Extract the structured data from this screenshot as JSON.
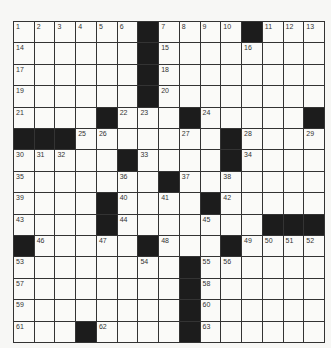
{
  "puzzle": {
    "rows": 15,
    "cols": 15,
    "blocks": [
      [
        0,
        6
      ],
      [
        0,
        11
      ],
      [
        1,
        6
      ],
      [
        2,
        6
      ],
      [
        3,
        6
      ],
      [
        4,
        4
      ],
      [
        4,
        8
      ],
      [
        4,
        14
      ],
      [
        5,
        0
      ],
      [
        5,
        1
      ],
      [
        5,
        2
      ],
      [
        5,
        10
      ],
      [
        6,
        5
      ],
      [
        6,
        10
      ],
      [
        7,
        7
      ],
      [
        8,
        4
      ],
      [
        8,
        9
      ],
      [
        9,
        4
      ],
      [
        9,
        12
      ],
      [
        9,
        13
      ],
      [
        9,
        14
      ],
      [
        10,
        0
      ],
      [
        10,
        6
      ],
      [
        10,
        10
      ],
      [
        11,
        8
      ],
      [
        12,
        8
      ],
      [
        13,
        8
      ],
      [
        14,
        3
      ],
      [
        14,
        8
      ]
    ],
    "numbers": [
      {
        "r": 0,
        "c": 0,
        "n": "1"
      },
      {
        "r": 0,
        "c": 1,
        "n": "2"
      },
      {
        "r": 0,
        "c": 2,
        "n": "3"
      },
      {
        "r": 0,
        "c": 3,
        "n": "4"
      },
      {
        "r": 0,
        "c": 4,
        "n": "5"
      },
      {
        "r": 0,
        "c": 5,
        "n": "6"
      },
      {
        "r": 0,
        "c": 7,
        "n": "7"
      },
      {
        "r": 0,
        "c": 8,
        "n": "8"
      },
      {
        "r": 0,
        "c": 9,
        "n": "9"
      },
      {
        "r": 0,
        "c": 10,
        "n": "10"
      },
      {
        "r": 0,
        "c": 12,
        "n": "11"
      },
      {
        "r": 0,
        "c": 13,
        "n": "12"
      },
      {
        "r": 0,
        "c": 14,
        "n": "13"
      },
      {
        "r": 1,
        "c": 0,
        "n": "14"
      },
      {
        "r": 1,
        "c": 7,
        "n": "15"
      },
      {
        "r": 1,
        "c": 11,
        "n": "16"
      },
      {
        "r": 2,
        "c": 0,
        "n": "17"
      },
      {
        "r": 2,
        "c": 7,
        "n": "18"
      },
      {
        "r": 3,
        "c": 0,
        "n": "19"
      },
      {
        "r": 3,
        "c": 7,
        "n": "20"
      },
      {
        "r": 4,
        "c": 0,
        "n": "21"
      },
      {
        "r": 4,
        "c": 5,
        "n": "22"
      },
      {
        "r": 4,
        "c": 6,
        "n": "23"
      },
      {
        "r": 4,
        "c": 9,
        "n": "24"
      },
      {
        "r": 5,
        "c": 3,
        "n": "25"
      },
      {
        "r": 5,
        "c": 4,
        "n": "26"
      },
      {
        "r": 5,
        "c": 8,
        "n": "27"
      },
      {
        "r": 5,
        "c": 11,
        "n": "28"
      },
      {
        "r": 5,
        "c": 14,
        "n": "29"
      },
      {
        "r": 6,
        "c": 0,
        "n": "30"
      },
      {
        "r": 6,
        "c": 1,
        "n": "31"
      },
      {
        "r": 6,
        "c": 2,
        "n": "32"
      },
      {
        "r": 6,
        "c": 6,
        "n": "33"
      },
      {
        "r": 6,
        "c": 11,
        "n": "34"
      },
      {
        "r": 7,
        "c": 0,
        "n": "35"
      },
      {
        "r": 7,
        "c": 5,
        "n": "36"
      },
      {
        "r": 7,
        "c": 8,
        "n": "37"
      },
      {
        "r": 7,
        "c": 10,
        "n": "38"
      },
      {
        "r": 8,
        "c": 0,
        "n": "39"
      },
      {
        "r": 8,
        "c": 5,
        "n": "40"
      },
      {
        "r": 8,
        "c": 7,
        "n": "41"
      },
      {
        "r": 8,
        "c": 10,
        "n": "42"
      },
      {
        "r": 9,
        "c": 0,
        "n": "43"
      },
      {
        "r": 9,
        "c": 5,
        "n": "44"
      },
      {
        "r": 9,
        "c": 9,
        "n": "45"
      },
      {
        "r": 10,
        "c": 1,
        "n": "46"
      },
      {
        "r": 10,
        "c": 4,
        "n": "47"
      },
      {
        "r": 10,
        "c": 7,
        "n": "48"
      },
      {
        "r": 10,
        "c": 11,
        "n": "49"
      },
      {
        "r": 10,
        "c": 12,
        "n": "50"
      },
      {
        "r": 10,
        "c": 13,
        "n": "51"
      },
      {
        "r": 10,
        "c": 14,
        "n": "52"
      },
      {
        "r": 11,
        "c": 0,
        "n": "53"
      },
      {
        "r": 11,
        "c": 6,
        "n": "54"
      },
      {
        "r": 11,
        "c": 9,
        "n": "55"
      },
      {
        "r": 11,
        "c": 10,
        "n": "56"
      },
      {
        "r": 12,
        "c": 0,
        "n": "57"
      },
      {
        "r": 12,
        "c": 9,
        "n": "58"
      },
      {
        "r": 13,
        "c": 0,
        "n": "59"
      },
      {
        "r": 13,
        "c": 9,
        "n": "60"
      },
      {
        "r": 14,
        "c": 0,
        "n": "61"
      },
      {
        "r": 14,
        "c": 4,
        "n": "62"
      },
      {
        "r": 14,
        "c": 9,
        "n": "63"
      }
    ]
  },
  "colors": {
    "block": "#1c1c1c",
    "cell": "#fafaf8",
    "line": "#333333"
  }
}
